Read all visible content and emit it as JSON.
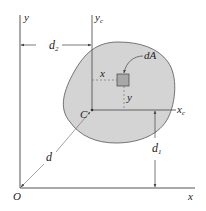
{
  "figure": {
    "colors": {
      "area_fill": "#d4d4d4",
      "area_stroke": "#555555",
      "axis": "#555555",
      "dimension": "#444444",
      "dashed": "#666666",
      "element_fill": "#a8a8a8",
      "element_stroke": "#444444",
      "text": "#222222"
    },
    "labels": {
      "y_axis": "y",
      "yc_axis": "y",
      "yc_sub": "c",
      "x_axis": "x",
      "xc_axis": "x",
      "xc_sub": "c",
      "origin": "O",
      "centroid": "C",
      "d2": "d",
      "d2_sub": "2",
      "d1": "d",
      "d1_sub": "1",
      "d": "d",
      "element": "dA",
      "element_x": "x",
      "element_y": "y"
    }
  }
}
